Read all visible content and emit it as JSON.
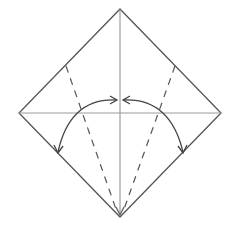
{
  "diagram": {
    "type": "origami-fold-instruction",
    "colors": {
      "background": "#ffffff",
      "outline": "#555555",
      "crease": "#8a8a8a",
      "valley_fold": "#555555",
      "arrow": "#444444"
    },
    "square": {
      "top": [
        120,
        9
      ],
      "right": [
        221,
        113
      ],
      "bottom": [
        120,
        217
      ],
      "left": [
        19,
        113
      ]
    },
    "creases": [
      {
        "name": "vertical-crease",
        "from": [
          120,
          9
        ],
        "to": [
          120,
          217
        ]
      },
      {
        "name": "horizontal-crease",
        "from": [
          19,
          113
        ],
        "to": [
          221,
          113
        ]
      }
    ],
    "valley_folds": [
      {
        "name": "left-valley-fold",
        "from": [
          66,
          66
        ],
        "to": [
          118,
          213
        ]
      },
      {
        "name": "right-valley-fold",
        "from": [
          175,
          66
        ],
        "to": [
          122,
          213
        ]
      }
    ],
    "arrows": [
      {
        "name": "left-fold-arrow",
        "description": "curved double arrow from top center to lower-left edge"
      },
      {
        "name": "right-fold-arrow",
        "description": "curved double arrow from top center to lower-right edge"
      }
    ]
  }
}
